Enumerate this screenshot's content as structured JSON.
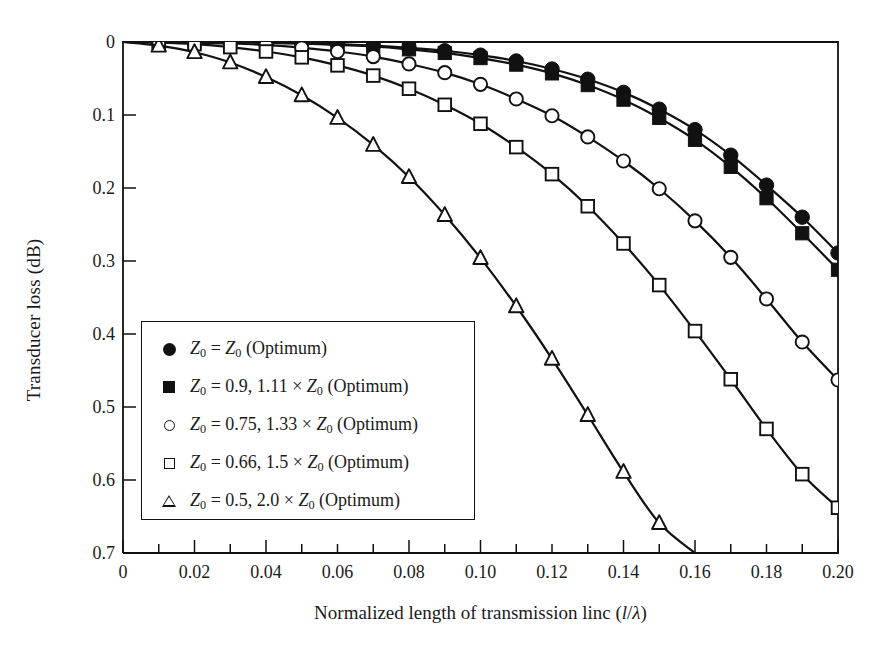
{
  "chart_data": {
    "type": "line",
    "title": "",
    "xlabel": "Normalized length of transmission linc (l/λ)",
    "ylabel": "Transducer loss (dB)",
    "xlim": [
      0,
      0.2
    ],
    "ylim": [
      0,
      0.7
    ],
    "y_inverted": true,
    "grid": false,
    "legend_position": "center-left",
    "xticks": [
      0,
      0.02,
      0.04,
      0.06,
      0.08,
      0.1,
      0.12,
      0.14,
      0.16,
      0.18,
      0.2
    ],
    "xtick_labels": [
      "0",
      "0.02",
      "0.04",
      "0.06",
      "0.08",
      "0.10",
      "0.12",
      "0.14",
      "0.16",
      "0.18",
      "0.20"
    ],
    "xtick_minor_step": 0.01,
    "yticks": [
      0,
      0.1,
      0.2,
      0.3,
      0.4,
      0.5,
      0.6,
      0.7
    ],
    "ytick_labels": [
      "0",
      "0.1",
      "0.2",
      "0.3",
      "0.4",
      "0.5",
      "0.6",
      "0.7"
    ],
    "x": [
      0.0,
      0.01,
      0.02,
      0.03,
      0.04,
      0.05,
      0.06,
      0.07,
      0.08,
      0.09,
      0.1,
      0.11,
      0.12,
      0.13,
      0.14,
      0.15,
      0.16,
      0.17,
      0.18,
      0.19,
      0.2
    ],
    "series": [
      {
        "name": "Z0 = Z0 (Optimum)",
        "marker": "filled-circle",
        "color": "#111111",
        "values": [
          0.0,
          0.0,
          0.0,
          0.0,
          0.001,
          0.002,
          0.003,
          0.005,
          0.008,
          0.012,
          0.018,
          0.026,
          0.037,
          0.051,
          0.069,
          0.092,
          0.12,
          0.155,
          0.196,
          0.24,
          0.289
        ]
      },
      {
        "name": "Z0 = 0.9, 1.11 × Z0 (Optimum)",
        "marker": "filled-square",
        "color": "#111111",
        "values": [
          0.0,
          0.0,
          0.0,
          0.0,
          0.001,
          0.002,
          0.004,
          0.006,
          0.01,
          0.015,
          0.022,
          0.031,
          0.043,
          0.059,
          0.079,
          0.104,
          0.134,
          0.171,
          0.214,
          0.262,
          0.312
        ]
      },
      {
        "name": "Z0 = 0.75, 1.33 × Z0 (Optimum)",
        "marker": "open-circle",
        "color": "#111111",
        "values": [
          0.0,
          0.0,
          0.001,
          0.002,
          0.004,
          0.008,
          0.013,
          0.02,
          0.03,
          0.042,
          0.058,
          0.078,
          0.101,
          0.13,
          0.163,
          0.201,
          0.245,
          0.295,
          0.352,
          0.411,
          0.463
        ]
      },
      {
        "name": "Z0 = 0.66, 1.5 × Z0 (Optimum)",
        "marker": "open-square",
        "color": "#111111",
        "values": [
          0.0,
          0.001,
          0.003,
          0.007,
          0.013,
          0.021,
          0.032,
          0.046,
          0.064,
          0.086,
          0.112,
          0.144,
          0.181,
          0.225,
          0.276,
          0.333,
          0.396,
          0.462,
          0.53,
          0.592,
          0.638
        ]
      },
      {
        "name": "Z0 = 0.5, 2.0 × Z0 (Optimum)",
        "marker": "open-triangle",
        "color": "#111111",
        "values": [
          0.0,
          0.005,
          0.014,
          0.028,
          0.048,
          0.073,
          0.104,
          0.141,
          0.185,
          0.237,
          0.296,
          0.362,
          0.434,
          0.511,
          0.589,
          0.659,
          0.7,
          null,
          null,
          null,
          null
        ]
      }
    ]
  },
  "axes": {
    "ylabel": "Transducer loss (dB)",
    "xlabel_prefix": "Normalized length of transmission linc (",
    "xlabel_var1": "l",
    "xlabel_slash": "/",
    "xlabel_var2": "λ",
    "xlabel_suffix": ")"
  },
  "legend": {
    "items": [
      {
        "marker": "filled-circle",
        "lead_var": "Z",
        "lead_sub": "0",
        "eq": " = ",
        "body": "",
        "tail_var": "Z",
        "tail_sub": "0",
        "suffix": " (Optimum)",
        "full_text": "Z0 = Z0 (Optimum)"
      },
      {
        "marker": "filled-square",
        "lead_var": "Z",
        "lead_sub": "0",
        "eq": " = ",
        "body": "0.9, 1.11 × ",
        "tail_var": "Z",
        "tail_sub": "0",
        "suffix": " (Optimum)",
        "full_text": "Z0 = 0.9, 1.11 × Z0 (Optimum)"
      },
      {
        "marker": "open-circle",
        "lead_var": "Z",
        "lead_sub": "0",
        "eq": " = ",
        "body": "0.75, 1.33 × ",
        "tail_var": "Z",
        "tail_sub": "0",
        "suffix": " (Optimum)",
        "full_text": "Z0 = 0.75, 1.33 × Z0 (Optimum)"
      },
      {
        "marker": "open-square",
        "lead_var": "Z",
        "lead_sub": "0",
        "eq": " = ",
        "body": "0.66, 1.5 × ",
        "tail_var": "Z",
        "tail_sub": "0",
        "suffix": " (Optimum)",
        "full_text": "Z0 = 0.66, 1.5 × Z0 (Optimum)"
      },
      {
        "marker": "open-triangle",
        "lead_var": "Z",
        "lead_sub": "0",
        "eq": " = ",
        "body": "0.5, 2.0 × ",
        "tail_var": "Z",
        "tail_sub": "0",
        "suffix": " (Optimum)",
        "full_text": "Z0 = 0.5, 2.0 × Z0 (Optimum)"
      }
    ]
  },
  "colors": {
    "axis": "#111111",
    "curve": "#111111",
    "background": "#ffffff"
  }
}
